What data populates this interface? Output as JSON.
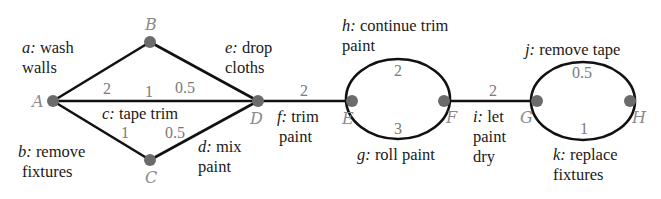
{
  "diagram": {
    "title": "",
    "colors": {
      "edge": "#111111",
      "node": "#6b6b6b",
      "node_label": "#8a8a8a",
      "weight": "#7a7a7a",
      "text": "#1a1a1a"
    },
    "nodes": [
      {
        "id": "A",
        "label": "A"
      },
      {
        "id": "B",
        "label": "B"
      },
      {
        "id": "C",
        "label": "C"
      },
      {
        "id": "D",
        "label": "D"
      },
      {
        "id": "E",
        "label": "E"
      },
      {
        "id": "F",
        "label": "F"
      },
      {
        "id": "G",
        "label": "G"
      },
      {
        "id": "H",
        "label": "H"
      }
    ],
    "tasks": {
      "a": {
        "key": "a:",
        "line1": " wash",
        "line2": "walls",
        "from": "A",
        "to": "B",
        "weight": "2"
      },
      "b": {
        "key": "b:",
        "line1": " remove",
        "line2": "fixtures",
        "from": "A",
        "to": "C",
        "weight": "1"
      },
      "c": {
        "key": "c:",
        "line1": " tape trim",
        "from": "A",
        "to": "D",
        "weight": "1"
      },
      "d": {
        "key": "d:",
        "line1": " mix",
        "line2": "paint",
        "from": "C",
        "to": "D",
        "weight": "0.5"
      },
      "e": {
        "key": "e:",
        "line1": " drop",
        "line2": "cloths",
        "from": "B",
        "to": "D",
        "weight": "0.5"
      },
      "f": {
        "key": "f:",
        "line1": " trim",
        "line2": "paint",
        "from": "D",
        "to": "E",
        "weight": "2"
      },
      "g": {
        "key": "g:",
        "line1": " roll paint",
        "from": "E",
        "to": "F",
        "weight": "3"
      },
      "h": {
        "key": "h:",
        "line1": " continue trim",
        "line2": "paint",
        "from": "E",
        "to": "F",
        "weight": "2"
      },
      "i": {
        "key": "i:",
        "line1": " let",
        "line2": "paint",
        "line3": "dry",
        "from": "F",
        "to": "G",
        "weight": "2"
      },
      "j": {
        "key": "j:",
        "line1": " remove tape",
        "from": "G",
        "to": "H",
        "weight": "0.5"
      },
      "k": {
        "key": "k:",
        "line1": " replace",
        "line2": "fixtures",
        "from": "G",
        "to": "H",
        "weight": "1"
      }
    }
  }
}
